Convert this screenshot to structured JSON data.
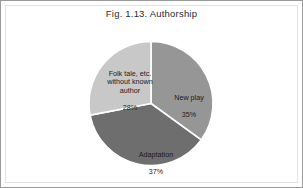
{
  "figure": {
    "title": "Fig. 1.13. Authorship",
    "background": "#ffffff",
    "border_color": "#9a9a9a",
    "inner_border_color": "#e2e2e2"
  },
  "chart_data": {
    "type": "pie",
    "title": "Fig. 1.13. Authorship",
    "xlabel": "",
    "ylabel": "",
    "legend": "none",
    "grid": false,
    "start_angle_deg": 0,
    "direction": "clockwise",
    "separator_color": "#ffffff",
    "categories": [
      "New play",
      "Adaptation",
      "Folk tale, etc. without known author"
    ],
    "values": [
      35,
      37,
      28
    ],
    "unit": "%",
    "colors": [
      "#969696",
      "#6e6e6e",
      "#c8c8c8"
    ],
    "slices": [
      {
        "label": "New play",
        "label_line1": "New play",
        "value": 35,
        "value_text": "35%",
        "color": "#969696",
        "text_color": "#1b1b1b"
      },
      {
        "label": "Adaptation",
        "label_line1": "Adaptation",
        "value": 37,
        "value_text": "37%",
        "color": "#6e6e6e",
        "text_color": "#1b1b1b"
      },
      {
        "label": "Folk tale, etc. without known author",
        "label_line1": "Folk tale, etc.\nwithout known\nauthor",
        "value": 28,
        "value_text": "28%",
        "color": "#c8c8c8",
        "text_color": "#1b1b1b"
      }
    ]
  }
}
